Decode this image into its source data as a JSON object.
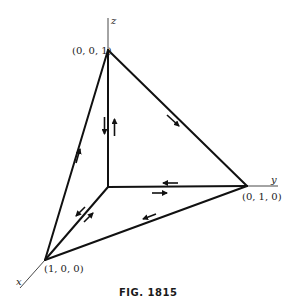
{
  "figure": {
    "caption": "FIG. 1815",
    "axes": {
      "x": "x",
      "y": "y",
      "z": "z"
    },
    "vertices": {
      "z_point": "(0, 0, 1)",
      "y_point": "(0, 1, 0)",
      "x_point": "(1, 0, 0)"
    },
    "colors": {
      "stroke": "#111111",
      "axis": "#333333",
      "background": "#ffffff"
    }
  }
}
